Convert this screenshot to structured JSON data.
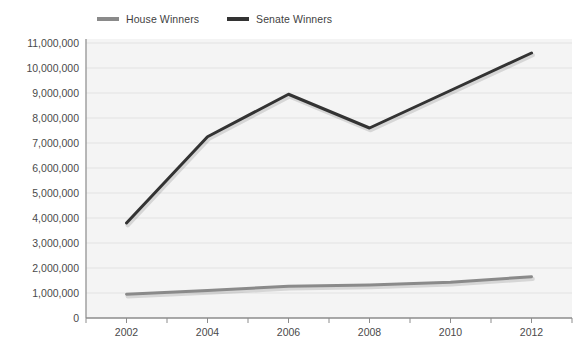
{
  "chart_data": {
    "type": "line",
    "title": "",
    "subtitle": "",
    "xlabel": "",
    "ylabel": "",
    "x": [
      2002,
      2004,
      2006,
      2008,
      2010,
      2012
    ],
    "categories": [
      "2002",
      "2004",
      "2006",
      "2008",
      "2010",
      "2012"
    ],
    "series": [
      {
        "name": "House Winners",
        "color": "#8a8a8a",
        "values": [
          950000,
          1100000,
          1270000,
          1320000,
          1430000,
          1650000
        ]
      },
      {
        "name": "Senate Winners",
        "color": "#333333",
        "values": [
          3800000,
          7250000,
          8950000,
          7600000,
          9100000,
          10600000
        ]
      }
    ],
    "ylim": [
      0,
      11000000
    ],
    "xlim": [
      2001,
      2013
    ],
    "ytick_labels": [
      "11,000,000",
      "10,000,000",
      "9,000,000",
      "8,000,000",
      "7,000,000",
      "6,000,000",
      "5,000,000",
      "4,000,000",
      "3,000,000",
      "2,000,000",
      "1,000,000",
      "0"
    ],
    "ytick_values": [
      11000000,
      10000000,
      9000000,
      8000000,
      7000000,
      6000000,
      5000000,
      4000000,
      3000000,
      2000000,
      1000000,
      0
    ],
    "xtick_labels": [
      "2002",
      "2004",
      "2006",
      "2008",
      "2010",
      "2012"
    ],
    "grid": true,
    "grid_axis": "y",
    "legend_position": "top-left",
    "plot_background": "#f4f4f4",
    "grid_color": "#e2e2e2",
    "axis_color": "#9a9a9a"
  },
  "legend": {
    "items": [
      {
        "label": "House Winners",
        "color": "#8a8a8a"
      },
      {
        "label": "Senate Winners",
        "color": "#333333"
      }
    ]
  }
}
